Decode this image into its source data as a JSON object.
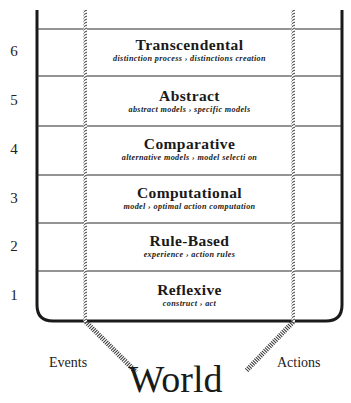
{
  "diagram": {
    "type": "layered-architecture",
    "levels": [
      {
        "number": "6",
        "title": "Transcendental",
        "subtitle": "distinction process › distinctions creation"
      },
      {
        "number": "5",
        "title": "Abstract",
        "subtitle": "abstract models › specific models"
      },
      {
        "number": "4",
        "title": "Comparative",
        "subtitle": "alternative models › model selecti on"
      },
      {
        "number": "3",
        "title": "Computational",
        "subtitle": "model › optimal action computation"
      },
      {
        "number": "2",
        "title": "Rule-Based",
        "subtitle": "experience › action rules"
      },
      {
        "number": "1",
        "title": "Reflexive",
        "subtitle": "construct › act"
      }
    ],
    "inputs_label": "Events",
    "outputs_label": "Actions",
    "environment_label": "World",
    "colors": {
      "line": "#1a1a1a",
      "background": "#ffffff"
    }
  }
}
